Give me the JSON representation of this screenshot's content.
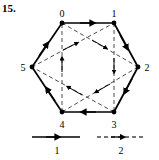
{
  "figure": {
    "number": "15."
  },
  "graph": {
    "shape": "hexagon",
    "vertex_labels": [
      "0",
      "1",
      "2",
      "3",
      "4",
      "5"
    ],
    "vertices": [
      {
        "label": "0",
        "x": 62,
        "y": 23,
        "lx": 58,
        "ly": 14
      },
      {
        "label": "1",
        "x": 114,
        "y": 23,
        "lx": 117,
        "ly": 14
      },
      {
        "label": "2",
        "x": 138,
        "y": 67,
        "lx": 146,
        "ly": 70
      },
      {
        "label": "3",
        "x": 114,
        "y": 112,
        "lx": 117,
        "ly": 127
      },
      {
        "label": "4",
        "x": 62,
        "y": 112,
        "lx": 58,
        "ly": 127
      },
      {
        "label": "5",
        "x": 32,
        "y": 67,
        "lx": 22,
        "ly": 70
      }
    ],
    "solid_edges": [
      {
        "from": "0",
        "to": "1"
      },
      {
        "from": "1",
        "to": "2"
      },
      {
        "from": "2",
        "to": "3"
      },
      {
        "from": "3",
        "to": "4"
      },
      {
        "from": "4",
        "to": "5"
      },
      {
        "from": "5",
        "to": "0"
      }
    ],
    "dashed_edges": [
      {
        "from": "4",
        "to": "0"
      },
      {
        "from": "1",
        "to": "3"
      },
      {
        "from": "5",
        "to": "1"
      },
      {
        "from": "0",
        "to": "2"
      },
      {
        "from": "3",
        "to": "5"
      },
      {
        "from": "2",
        "to": "4"
      }
    ],
    "edge_color": "#000000",
    "vertex_color": "#000000"
  },
  "legend": {
    "items": [
      {
        "label": "1",
        "style": "solid",
        "x1": 32,
        "x2": 80,
        "y": 137,
        "lx": 57,
        "ly": 153
      },
      {
        "label": "2",
        "style": "dashed",
        "x1": 97,
        "x2": 145,
        "y": 137,
        "lx": 121,
        "ly": 153
      }
    ]
  }
}
